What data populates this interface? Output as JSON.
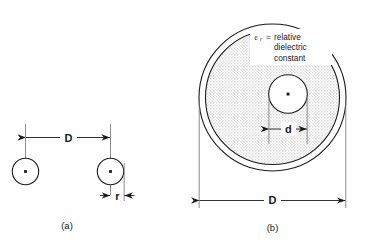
{
  "figure": {
    "panels": [
      {
        "id": "a",
        "caption": "(a)",
        "dimensions": [
          {
            "name": "separation",
            "label": "D"
          },
          {
            "name": "radius",
            "label": "r"
          }
        ]
      },
      {
        "id": "b",
        "caption": "(b)",
        "dimensions": [
          {
            "name": "inner-conductor-diameter",
            "label": "d"
          },
          {
            "name": "outer-diameter",
            "label": "D"
          }
        ],
        "annotation": {
          "symbol": "ε",
          "subscript": "r",
          "equals": "=",
          "line1": "relative",
          "line2": "dielectric",
          "line3": "constant",
          "full_text": "εr = relative dielectric constant"
        }
      }
    ],
    "colors": {
      "stroke": "#1a1a1a",
      "dielectric_fill": "#e6e6e6",
      "conductor_fill": "#ffffff",
      "background": "#ffffff"
    }
  }
}
